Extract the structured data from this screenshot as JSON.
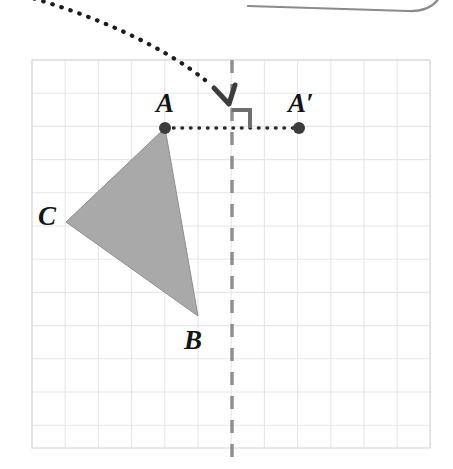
{
  "figure": {
    "canvas": {
      "width": 453,
      "height": 469,
      "background": "#ffffff"
    },
    "grid": {
      "x0": 32,
      "y0": 60,
      "x1": 430,
      "y1": 448,
      "cell": 33.2,
      "line_color": "#e4e6ea",
      "visible": true
    },
    "mirror_line": {
      "name": "line-of-reflection",
      "x": 232,
      "y_top": 60,
      "y_bottom": 462,
      "color": "#8d8d8d",
      "width": 3.4,
      "dash": "13 11"
    },
    "triangle": {
      "name": "triangle-ABC",
      "fill": "#a9a9a9",
      "stroke": "#8e8e8e",
      "stroke_width": 1,
      "vertices": [
        {
          "label": "A",
          "x": 165,
          "y": 128
        },
        {
          "label": "B",
          "x": 198,
          "y": 316
        },
        {
          "label": "C",
          "x": 66,
          "y": 222
        }
      ]
    },
    "points": [
      {
        "name": "point-A",
        "label": "A",
        "x": 165,
        "y": 128,
        "r": 6,
        "color": "#3c3c3c",
        "label_x": 156,
        "label_y": 90
      },
      {
        "name": "point-A-prime",
        "label": "A′",
        "x": 299,
        "y": 128,
        "r": 6,
        "color": "#3c3c3c",
        "label_x": 288,
        "label_y": 90
      },
      {
        "name": "point-B",
        "label": "B",
        "x": 198,
        "y": 316,
        "r": 0,
        "color": "#3c3c3c",
        "label_x": 184,
        "label_y": 327
      },
      {
        "name": "point-C",
        "label": "C",
        "x": 66,
        "y": 222,
        "r": 0,
        "color": "#3c3c3c",
        "label_x": 38,
        "label_y": 203
      }
    ],
    "reflection_segment": {
      "name": "dotted-connector-A-to-A-prime",
      "x1": 165,
      "y1": 128,
      "x2": 299,
      "y2": 128,
      "color": "#2b2b2b",
      "width": 3.6,
      "dash": "0.5 8"
    },
    "right_angle_marker": {
      "name": "right-angle-marker",
      "corner_x": 232,
      "corner_y": 128,
      "size": 18,
      "color": "#6f6f6f",
      "width": 4
    },
    "curved_arrow": {
      "name": "dotted-curved-arrow",
      "path": "M 25 -4 C 90 14, 160 44, 205 80",
      "color": "#1c1c1c",
      "width": 4.2,
      "dash": "0.5 9",
      "arrowhead": {
        "tip_x": 233,
        "tip_y": 104,
        "color": "#3d3d3d",
        "width": 5
      }
    },
    "top_panel_edge": {
      "name": "rounded-panel-bottom-edge",
      "path": "M 248 6 L 408 11 Q 432 12 440 -4",
      "color": "#8a8a8a",
      "width": 2.2
    }
  },
  "labels": {
    "A": "A",
    "A_prime": "A′",
    "B": "B",
    "C": "C"
  }
}
